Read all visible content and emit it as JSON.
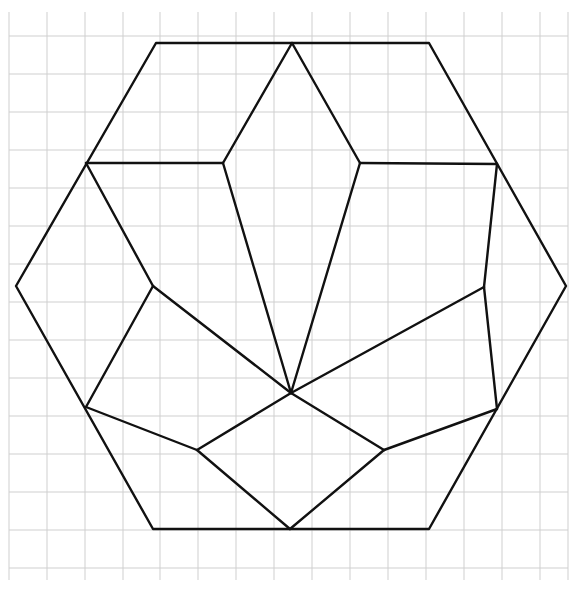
{
  "diagram": {
    "canvas": {
      "width": 572,
      "height": 594
    },
    "colors": {
      "background": "#ffffff",
      "grid": "#cfcfcf",
      "edge": "#111111"
    },
    "grid": {
      "x_lines": [
        9,
        47,
        85,
        123,
        160,
        198,
        236,
        274,
        312,
        350,
        388,
        426,
        464,
        502,
        540,
        568
      ],
      "y_lines": [
        36,
        74,
        112,
        150,
        188,
        226,
        264,
        302,
        340,
        378,
        416,
        454,
        492,
        530,
        568
      ],
      "x_extent": [
        9,
        568
      ],
      "y_extent": [
        12,
        580
      ]
    },
    "vertices": {
      "H_TL": [
        156,
        43
      ],
      "H_TOP": [
        292,
        43
      ],
      "H_TR": [
        429,
        43
      ],
      "H_UL": [
        86,
        163
      ],
      "H_UR": [
        497,
        164
      ],
      "H_L": [
        16,
        286
      ],
      "H_R": [
        566,
        286
      ],
      "H_LL": [
        86,
        407
      ],
      "H_LR": [
        497,
        409
      ],
      "H_BL": [
        153,
        529
      ],
      "H_BOT": [
        290,
        529
      ],
      "H_BR": [
        429,
        529
      ],
      "I_UL": [
        223,
        163
      ],
      "I_UR": [
        360,
        163
      ],
      "I_ML": [
        153,
        286
      ],
      "I_MR": [
        484,
        287
      ],
      "CENTER": [
        291,
        393
      ],
      "I_LL": [
        197,
        450
      ],
      "I_LR": [
        384,
        450
      ]
    },
    "outline": [
      "H_TL",
      "H_TR",
      "H_R",
      "H_BR",
      "H_BL",
      "H_L"
    ],
    "edges": [
      [
        "H_TOP",
        "I_UL"
      ],
      [
        "H_TOP",
        "I_UR"
      ],
      [
        "H_UL",
        "I_UL"
      ],
      [
        "I_UR",
        "H_UR"
      ],
      [
        "I_UL",
        "CENTER"
      ],
      [
        "I_UR",
        "CENTER"
      ],
      [
        "H_UL",
        "I_ML"
      ],
      [
        "I_ML",
        "CENTER"
      ],
      [
        "I_ML",
        "H_LL"
      ],
      [
        "H_UR",
        "I_MR"
      ],
      [
        "I_MR",
        "CENTER"
      ],
      [
        "I_MR",
        "H_LR"
      ],
      [
        "H_LL",
        "I_LL"
      ],
      [
        "I_LL",
        "CENTER"
      ],
      [
        "I_LL",
        "H_BOT"
      ],
      [
        "H_LR",
        "I_LR"
      ],
      [
        "I_LR",
        "CENTER"
      ],
      [
        "I_LR",
        "H_BOT"
      ]
    ]
  }
}
